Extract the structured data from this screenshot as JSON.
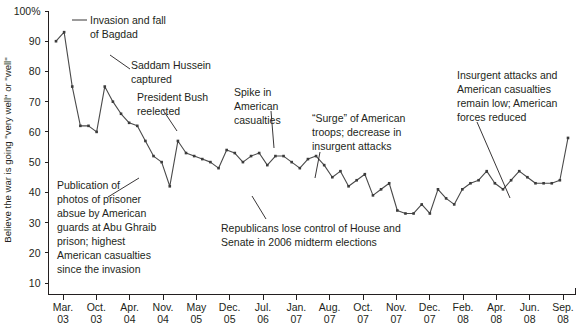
{
  "chart_data": {
    "type": "line",
    "title": "",
    "xlabel": "",
    "ylabel": "Believe the war is going \"very well\" or \"well\"",
    "ylim": [
      0,
      100
    ],
    "yticks": [
      10,
      20,
      30,
      40,
      50,
      60,
      70,
      80,
      90,
      100
    ],
    "ytick_labels": [
      "10",
      "20",
      "30",
      "40",
      "50",
      "60",
      "70",
      "80",
      "90",
      "100%"
    ],
    "grid": false,
    "legend": "none",
    "xtick_labels": [
      "Mar.\n03",
      "Oct.\n03",
      "Apr.\n04",
      "Nov.\n04",
      "May\n05",
      "Dec.\n05",
      "Jul.\n06",
      "Jan.\n07",
      "Aug.\n07",
      "Oct.\n07",
      "Nov.\n07",
      "Dec.\n07",
      "Feb.\n08",
      "Apr.\n08",
      "Jun.\n08",
      "Sep.\n08"
    ],
    "xticks": [
      {
        "month": "Mar.",
        "year": "03"
      },
      {
        "month": "Oct.",
        "year": "03"
      },
      {
        "month": "Apr.",
        "year": "04"
      },
      {
        "month": "Nov.",
        "year": "04"
      },
      {
        "month": "May",
        "year": "05"
      },
      {
        "month": "Dec.",
        "year": "05"
      },
      {
        "month": "Jul.",
        "year": "06"
      },
      {
        "month": "Jan.",
        "year": "07"
      },
      {
        "month": "Aug.",
        "year": "07"
      },
      {
        "month": "Oct.",
        "year": "07"
      },
      {
        "month": "Nov.",
        "year": "07"
      },
      {
        "month": "Dec.",
        "year": "07"
      },
      {
        "month": "Feb.",
        "year": "08"
      },
      {
        "month": "Apr.",
        "year": "08"
      },
      {
        "month": "Jun.",
        "year": "08"
      },
      {
        "month": "Sep.",
        "year": "08"
      }
    ],
    "x": [
      0,
      1,
      2,
      3,
      4,
      5,
      6,
      7,
      8,
      9,
      10,
      11,
      12,
      13,
      14,
      15,
      16,
      17,
      18,
      19,
      20,
      21,
      22,
      23,
      24,
      25,
      26,
      27,
      28,
      29,
      30,
      31,
      32,
      33,
      34,
      35,
      36,
      37,
      38,
      39,
      40,
      41,
      42,
      43,
      44,
      45,
      46,
      47,
      48,
      49,
      50,
      51,
      52,
      53,
      54,
      55,
      56,
      57,
      58,
      59,
      60,
      61,
      62,
      63
    ],
    "values": [
      90,
      93,
      75,
      62,
      62,
      60,
      75,
      70,
      66,
      63,
      62,
      57,
      52,
      50,
      42,
      57,
      53,
      52,
      51,
      50,
      48,
      54,
      53,
      50,
      52,
      53,
      49,
      52,
      52,
      50,
      48,
      51,
      52,
      49,
      45,
      47,
      42,
      44,
      46,
      39,
      41,
      43,
      34,
      33,
      33,
      36,
      33,
      41,
      38,
      36,
      41,
      43,
      44,
      47,
      43,
      41,
      44,
      47,
      45,
      43,
      43,
      43,
      44,
      58
    ],
    "annotations": [
      {
        "id": "invasion-fall-baghdad",
        "lines": [
          "Invasion and fall",
          "of Bagdad"
        ]
      },
      {
        "id": "saddam-captured",
        "lines": [
          "Saddam Hussein",
          "captured"
        ]
      },
      {
        "id": "bush-reelected",
        "lines": [
          "President Bush",
          "reelected"
        ]
      },
      {
        "id": "abu-ghraib",
        "lines": [
          "Publication of",
          "photos of prisoner",
          "absue by American",
          "guards at Abu Ghraib",
          "prison; highest",
          "American casualties",
          "since the invasion"
        ]
      },
      {
        "id": "spike-casualties",
        "lines": [
          "Spike in",
          "American",
          "casualties"
        ]
      },
      {
        "id": "midterm-elections",
        "lines": [
          "Republicans lose control of House and",
          "Senate in 2006 midterm elections"
        ]
      },
      {
        "id": "surge",
        "lines": [
          "“Surge” of American",
          "troops; decrease in",
          "insurgent attacks"
        ]
      },
      {
        "id": "attacks-remain-low",
        "lines": [
          "Insurgent attacks and",
          "American casualties",
          "remain low; American",
          "forces reduced"
        ]
      }
    ],
    "colors": {
      "line": "#4a4a4a",
      "axis": "#231f20",
      "text": "#231f20",
      "background": "#ffffff"
    }
  }
}
